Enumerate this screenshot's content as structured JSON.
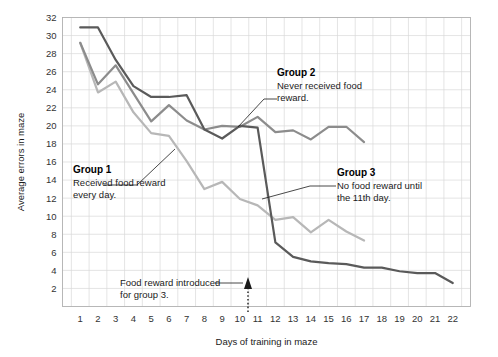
{
  "chart_data": {
    "type": "line",
    "title": "",
    "xlabel": "Days of training in maze",
    "ylabel": "Average errors in maze",
    "xlim": [
      1,
      22
    ],
    "ylim": [
      0,
      32
    ],
    "yticks": [
      2,
      4,
      6,
      8,
      10,
      12,
      14,
      16,
      18,
      20,
      22,
      24,
      26,
      28,
      30,
      32
    ],
    "xticks": [
      1,
      2,
      3,
      4,
      5,
      6,
      7,
      8,
      9,
      10,
      11,
      12,
      13,
      14,
      15,
      16,
      17,
      18,
      19,
      20,
      21,
      22
    ],
    "grid": true,
    "legend_position": "inline-annotations",
    "series": [
      {
        "name": "Group 1",
        "color": "#b7b7b7",
        "x": [
          1,
          2,
          3,
          4,
          5,
          6,
          7,
          8,
          9,
          10,
          11,
          12,
          13,
          14,
          15,
          16,
          17
        ],
        "values": [
          29.2,
          23.7,
          24.9,
          21.5,
          19.2,
          18.9,
          16.1,
          13.0,
          13.8,
          11.9,
          11.2,
          9.6,
          9.9,
          8.2,
          9.6,
          8.3,
          7.3
        ]
      },
      {
        "name": "Group 2",
        "color": "#8c8c8c",
        "x": [
          1,
          2,
          3,
          4,
          5,
          6,
          7,
          8,
          9,
          10,
          11,
          12,
          13,
          14,
          15,
          16,
          17
        ],
        "values": [
          29.2,
          24.6,
          26.7,
          23.6,
          20.5,
          22.3,
          20.6,
          19.6,
          20.0,
          19.9,
          21.0,
          19.3,
          19.5,
          18.5,
          19.9,
          19.9,
          18.2
        ]
      },
      {
        "name": "Group 3",
        "color": "#5a5a5a",
        "x": [
          1,
          2,
          3,
          4,
          5,
          6,
          7,
          8,
          9,
          10,
          11,
          12,
          13,
          14,
          15,
          16,
          17,
          18,
          19,
          20,
          21,
          22
        ],
        "values": [
          30.9,
          30.9,
          27.3,
          24.4,
          23.2,
          23.2,
          23.4,
          19.6,
          18.6,
          20.0,
          19.8,
          7.1,
          5.5,
          5.0,
          4.8,
          4.7,
          4.3,
          4.3,
          3.9,
          3.7,
          3.7,
          2.6
        ]
      }
    ],
    "annotations": [
      {
        "id": "group1",
        "title": "Group 1",
        "lines": [
          "Received food reward",
          "every day."
        ]
      },
      {
        "id": "group2",
        "title": "Group 2",
        "lines": [
          "Never received food",
          "reward."
        ]
      },
      {
        "id": "group3",
        "title": "Group 3",
        "lines": [
          "No food reward until",
          "the 11th day."
        ]
      },
      {
        "id": "food-reward-intro",
        "title": "",
        "lines": [
          "Food reward introduced",
          "for group 3."
        ]
      }
    ]
  },
  "colors": {
    "group1": "#b7b7b7",
    "group2": "#8c8c8c",
    "group3": "#5a5a5a",
    "grid": "#d9d9d9",
    "border": "#b0b0b0",
    "text": "#1a1a1a"
  }
}
